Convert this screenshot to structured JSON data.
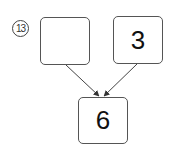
{
  "problem": {
    "number": "13",
    "inputs": [
      {
        "value": ""
      },
      {
        "value": "3"
      }
    ],
    "result": {
      "value": "6"
    }
  },
  "colors": {
    "stroke": "#555555",
    "text": "#111111"
  }
}
